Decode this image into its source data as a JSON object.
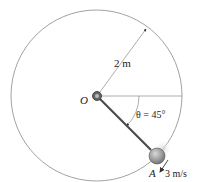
{
  "diagram": {
    "radius_label": "2 m",
    "origin_label": "O",
    "angle_label": "θ = 45°",
    "point_label": "A",
    "velocity_label": "3 m/s",
    "colors": {
      "circle": "#8a8a8a",
      "rod": "#4a4a4a",
      "ball": "#9a9a9a",
      "text": "#222222"
    }
  }
}
